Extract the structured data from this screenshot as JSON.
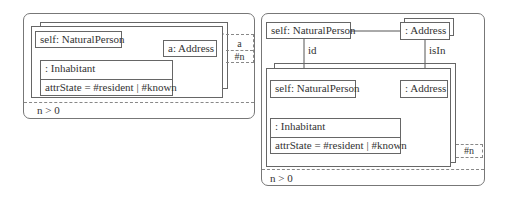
{
  "left_diagram": {
    "self_object": "self: NaturalPerson",
    "address_object": "a: Address",
    "role_object": ": Inhabitant",
    "role_attribute": "attrState = #resident | #known",
    "tab_top": "a",
    "tab_bottom": "#n",
    "constraint": "n > 0"
  },
  "right_diagram": {
    "self_object_top": "self: NaturalPerson",
    "address_object_top": ": Address",
    "link_id": "id",
    "link_isIn": "isIn",
    "self_object_inner": "self: NaturalPerson",
    "address_object_inner": ": Address",
    "role_object": ": Inhabitant",
    "role_attribute": "attrState = #resident | #known",
    "tab": "#n",
    "constraint": "n > 0"
  }
}
